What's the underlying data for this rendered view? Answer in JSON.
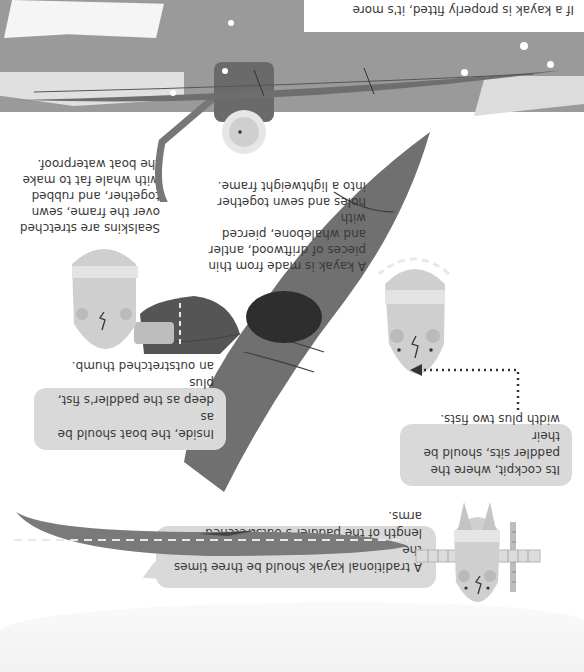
{
  "page": {
    "orientation": "rotated 180 degrees",
    "palette": {
      "background": "#ffffff",
      "bubble": "#d9d9d9",
      "kayak_dark": "#6e6e6e",
      "kayak_mid": "#8a8a8a",
      "sea_band": "#9a9a9a",
      "ice": "#f2f2f2",
      "face": "#c8c8c8",
      "text": "#3a3a3a"
    }
  },
  "bubbles": {
    "length": {
      "lines": [
        "A traditional kayak should be three times the",
        "length of the paddler's outstretched arms."
      ]
    },
    "cockpit": {
      "lines": [
        "Its cockpit, where the",
        "paddler sits, should be their",
        "width plus two fists."
      ]
    },
    "depth": {
      "lines": [
        "Inside, the boat should be as",
        "deep as the paddler's fist, plus",
        "an outstretched thumb."
      ]
    }
  },
  "captions": {
    "frame": {
      "lines": [
        "A kayak is made from thin",
        "pieces of driftwood, antler",
        "and whalebone, pierced with",
        "holes and sewn together",
        "into a lightweight frame."
      ]
    },
    "sealskins": {
      "lines": [
        "Sealskins are stretched",
        "over the frame, sewn",
        "together, and rubbed",
        "with whale fat to make",
        "the boat waterproof."
      ]
    },
    "fitted": {
      "lines": [
        "If a kayak is properly fitted, it's more"
      ]
    }
  },
  "illustrations": {
    "icons": [
      "paddler-arms-outstretched",
      "kayak-side-view",
      "kayak-top-view",
      "paddler-in-cockpit",
      "paddler-fist-thumb",
      "kayak-cross-section",
      "paddler-with-paddle",
      "kayak-on-sea",
      "ice-floe",
      "tape-measure"
    ]
  }
}
